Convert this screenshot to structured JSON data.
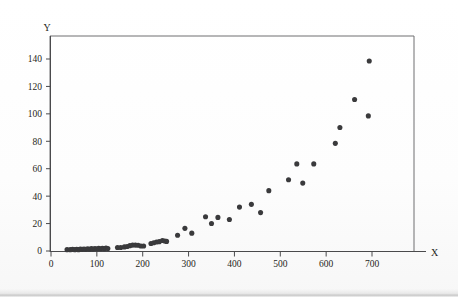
{
  "figure": {
    "title": "",
    "axis_title_x": "X",
    "axis_title_y": "Y",
    "dot_color": "#3a3a3c",
    "frame_color": "#6e6e70",
    "axis_color": "#4a4a4c",
    "background_color": "#fdfdfc"
  },
  "chart_data": {
    "type": "scatter",
    "title": "",
    "xlabel": "X",
    "ylabel": "Y",
    "xlim": [
      0,
      790
    ],
    "ylim": [
      0,
      152
    ],
    "xticks": [
      0,
      100,
      200,
      300,
      400,
      500,
      600,
      700
    ],
    "xticklabels": [
      "0",
      "100",
      "200",
      "300",
      "400",
      "500",
      "600",
      "700"
    ],
    "yticks": [
      0,
      20,
      40,
      60,
      80,
      100,
      120,
      140
    ],
    "yticklabels": [
      "0",
      "20",
      "40",
      "60",
      "80",
      "100",
      "120",
      "140"
    ],
    "grid": false,
    "legend": null,
    "marker": "filled-circle",
    "marker_size": 3,
    "n_points": 62,
    "points": [
      [
        35,
        1.0
      ],
      [
        42,
        1.0
      ],
      [
        47,
        1.2
      ],
      [
        52,
        1.0
      ],
      [
        56,
        1.3
      ],
      [
        60,
        1.0
      ],
      [
        64,
        1.4
      ],
      [
        68,
        1.2
      ],
      [
        72,
        1.5
      ],
      [
        76,
        1.2
      ],
      [
        80,
        1.6
      ],
      [
        84,
        1.3
      ],
      [
        88,
        1.7
      ],
      [
        92,
        1.4
      ],
      [
        96,
        1.8
      ],
      [
        100,
        1.5
      ],
      [
        104,
        1.9
      ],
      [
        108,
        1.6
      ],
      [
        112,
        2.0
      ],
      [
        116,
        1.7
      ],
      [
        120,
        2.1
      ],
      [
        124,
        1.8
      ],
      [
        145,
        2.5
      ],
      [
        152,
        2.6
      ],
      [
        160,
        3.0
      ],
      [
        166,
        3.3
      ],
      [
        172,
        3.9
      ],
      [
        178,
        4.3
      ],
      [
        184,
        4.3
      ],
      [
        190,
        4.2
      ],
      [
        196,
        3.6
      ],
      [
        202,
        3.6
      ],
      [
        218,
        5.5
      ],
      [
        224,
        6.0
      ],
      [
        230,
        6.6
      ],
      [
        236,
        6.8
      ],
      [
        243,
        7.7
      ],
      [
        248,
        7.3
      ],
      [
        252,
        7.0
      ],
      [
        276,
        11.5
      ],
      [
        292,
        16.5
      ],
      [
        307,
        13.0
      ],
      [
        337,
        25.0
      ],
      [
        350,
        20.0
      ],
      [
        364,
        24.5
      ],
      [
        389,
        23.0
      ],
      [
        411,
        32.0
      ],
      [
        437,
        34.0
      ],
      [
        457,
        28.0
      ],
      [
        475,
        44.0
      ],
      [
        518,
        52.0
      ],
      [
        536,
        63.5
      ],
      [
        549,
        49.5
      ],
      [
        573,
        63.5
      ],
      [
        620,
        78.5
      ],
      [
        630,
        90.0
      ],
      [
        662,
        110.5
      ],
      [
        692,
        98.5
      ],
      [
        694,
        138.5
      ]
    ]
  }
}
